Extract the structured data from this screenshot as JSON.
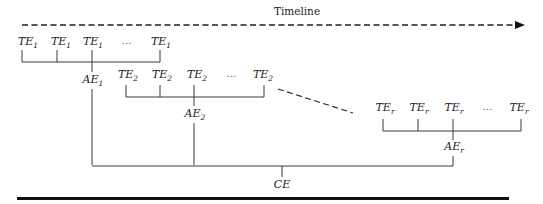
{
  "timeline": {
    "label": "Timeline"
  },
  "groups": [
    {
      "id": "group-1",
      "items": [
        {
          "base": "TE",
          "sub": "1"
        },
        {
          "base": "TE",
          "sub": "1"
        },
        {
          "base": "TE",
          "sub": "1"
        },
        {
          "base": "…",
          "sub": ""
        },
        {
          "base": "TE",
          "sub": "1"
        }
      ],
      "aggregate": {
        "base": "AE",
        "sub": "1"
      }
    },
    {
      "id": "group-2",
      "items": [
        {
          "base": "TE",
          "sub": "2"
        },
        {
          "base": "TE",
          "sub": "2"
        },
        {
          "base": "TE",
          "sub": "2"
        },
        {
          "base": "…",
          "sub": ""
        },
        {
          "base": "TE",
          "sub": "2"
        }
      ],
      "aggregate": {
        "base": "AE",
        "sub": "2"
      }
    },
    {
      "id": "group-r",
      "items": [
        {
          "base": "TE",
          "sub": "r"
        },
        {
          "base": "TE",
          "sub": "r"
        },
        {
          "base": "TE",
          "sub": "r"
        },
        {
          "base": "…",
          "sub": ""
        },
        {
          "base": "TE",
          "sub": "r"
        }
      ],
      "aggregate": {
        "base": "AE",
        "sub": "r"
      }
    }
  ],
  "combined": {
    "label": "CE"
  }
}
